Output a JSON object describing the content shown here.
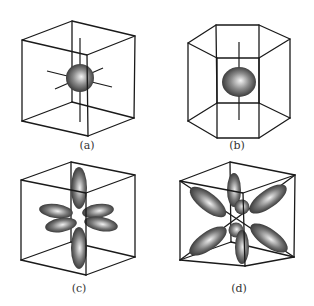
{
  "figure": {
    "panels": [
      {
        "id": "a",
        "label": "(a)",
        "shape": "cube",
        "content": "sphere with three axes"
      },
      {
        "id": "b",
        "label": "(b)",
        "shape": "hexagonal-prism",
        "content": "oblate sphere with vertical axis"
      },
      {
        "id": "c",
        "label": "(c)",
        "shape": "cube",
        "content": "six ellipsoidal lobes along three axes"
      },
      {
        "id": "d",
        "label": "(d)",
        "shape": "cube",
        "content": "eight lobes along body diagonals"
      }
    ],
    "colors": {
      "line": "#1a1a1a",
      "shade_light": "#f2f2f2",
      "shade_dark": "#1e1e1e",
      "background": "#ffffff"
    }
  }
}
